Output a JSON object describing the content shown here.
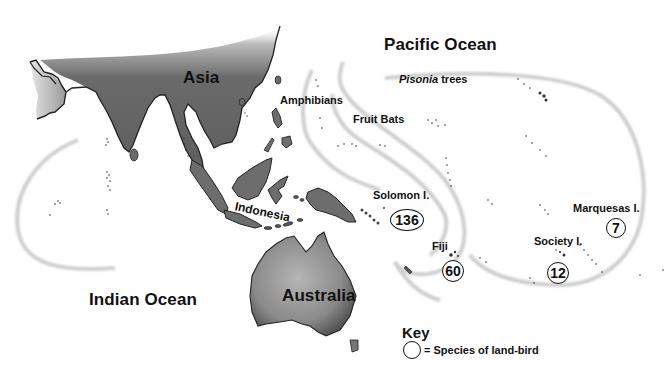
{
  "map": {
    "oceans": {
      "pacific": "Pacific Ocean",
      "indian": "Indian Ocean"
    },
    "landmasses": {
      "asia": "Asia",
      "australia": "Australia",
      "indonesia": "Indonesia"
    },
    "dispersal_limits": {
      "amphibians": "Amphibians",
      "fruit_bats": "Fruit Bats",
      "pisonia_genus": "Pisonia",
      "pisonia_suffix": " trees"
    },
    "island_groups": [
      {
        "name": "Solomon I.",
        "land_bird_species": "136"
      },
      {
        "name": "Fiji",
        "land_bird_species": "60"
      },
      {
        "name": "Society I.",
        "land_bird_species": "12"
      },
      {
        "name": "Marquesas I.",
        "land_bird_species": "7"
      }
    ],
    "colors": {
      "land_fill": "#6f6f6f",
      "land_outline": "#222222",
      "band": "#c8c8c8",
      "text": "#111111"
    }
  },
  "key": {
    "title": "Key",
    "circle_meaning": "= Species of land-bird"
  }
}
